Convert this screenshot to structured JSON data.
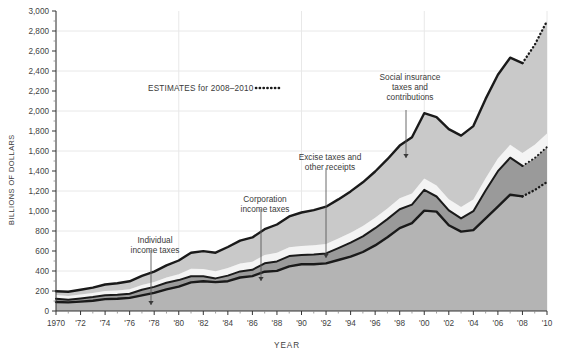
{
  "chart_data": {
    "type": "area",
    "title": "",
    "xlabel": "YEAR",
    "ylabel": "BILLIONS OF DOLLARS",
    "ylim": [
      0,
      3000
    ],
    "xlim": [
      1970,
      2010
    ],
    "ytick_step": 200,
    "ytick_labels": [
      "0",
      "200",
      "400",
      "600",
      "800",
      "1,000",
      "1,200",
      "1,400",
      "1,600",
      "1,800",
      "2,000",
      "2,200",
      "2,400",
      "2,600",
      "2,800",
      "3,000"
    ],
    "xtick_labels": [
      "1970",
      "'72",
      "'74",
      "'76",
      "'78",
      "'80",
      "'82",
      "'84",
      "'86",
      "'88",
      "'90",
      "'92",
      "'94",
      "'96",
      "'98",
      "'00",
      "'02",
      "'04",
      "'06",
      "'08",
      "'10"
    ],
    "grid": {
      "horizontal_every": 400,
      "vertical_every": 10,
      "color": "#e8e8e8"
    },
    "legend_position": "annotations-inline",
    "stacked": true,
    "estimate_start_year": 2008,
    "x": [
      1970,
      1971,
      1972,
      1973,
      1974,
      1975,
      1976,
      1977,
      1978,
      1979,
      1980,
      1981,
      1982,
      1983,
      1984,
      1985,
      1986,
      1987,
      1988,
      1989,
      1990,
      1991,
      1992,
      1993,
      1994,
      1995,
      1996,
      1997,
      1998,
      1999,
      2000,
      2001,
      2002,
      2003,
      2004,
      2005,
      2006,
      2007,
      2008,
      2009,
      2010
    ],
    "series": [
      {
        "name": "Individual income taxes",
        "order": 1,
        "color": "#b4b4b4",
        "values": [
          90,
          86,
          94,
          103,
          119,
          122,
          131,
          157,
          181,
          217,
          244,
          286,
          298,
          289,
          298,
          335,
          349,
          393,
          401,
          446,
          467,
          468,
          476,
          510,
          543,
          590,
          656,
          737,
          829,
          879,
          1004,
          994,
          858,
          794,
          809,
          927,
          1044,
          1163,
          1146,
          1210,
          1290
        ]
      },
      {
        "name": "Corporation income taxes",
        "order": 2,
        "color": "#9a9a9a",
        "values": [
          33,
          27,
          32,
          36,
          39,
          41,
          42,
          55,
          60,
          66,
          65,
          61,
          49,
          37,
          56,
          61,
          63,
          84,
          95,
          103,
          94,
          98,
          100,
          118,
          140,
          157,
          172,
          182,
          189,
          185,
          207,
          151,
          148,
          132,
          189,
          278,
          354,
          370,
          305,
          320,
          350
        ]
      },
      {
        "name": "Excise taxes and other receipts",
        "order": 3,
        "color": "#f4f4f4",
        "values": [
          37,
          38,
          39,
          40,
          42,
          43,
          45,
          47,
          50,
          53,
          58,
          76,
          72,
          72,
          76,
          79,
          81,
          82,
          86,
          88,
          90,
          92,
          95,
          98,
          100,
          102,
          104,
          107,
          110,
          112,
          114,
          110,
          112,
          115,
          118,
          122,
          126,
          130,
          128,
          132,
          136
        ]
      },
      {
        "name": "Social insurance taxes and contributions",
        "order": 4,
        "color": "#c9c9c9",
        "values": [
          37,
          42,
          48,
          55,
          65,
          72,
          79,
          92,
          103,
          120,
          138,
          160,
          180,
          185,
          210,
          229,
          243,
          259,
          283,
          309,
          334,
          351,
          372,
          390,
          413,
          438,
          463,
          492,
          526,
          562,
          653,
          684,
          701,
          713,
          733,
          794,
          838,
          870,
          900,
          1000,
          1124
        ]
      }
    ],
    "annotations": [
      {
        "id": "individual-income-taxes",
        "text_lines": [
          "Individual",
          "income taxes"
        ],
        "arrow": "down"
      },
      {
        "id": "corporation-income-taxes",
        "text_lines": [
          "Corporation",
          "income taxes"
        ],
        "arrow": "down"
      },
      {
        "id": "excise-taxes",
        "text_lines": [
          "Excise taxes and",
          "other receipts"
        ],
        "arrow": "down"
      },
      {
        "id": "social-insurance",
        "text_lines": [
          "Social insurance",
          "taxes and",
          "contributions"
        ],
        "arrow": "down"
      },
      {
        "id": "estimates",
        "text": "ESTIMATES for 2008–2010",
        "arrow": "none"
      }
    ]
  }
}
